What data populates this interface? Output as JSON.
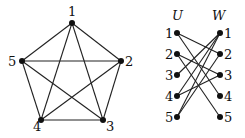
{
  "k5": {
    "vertices": [
      {
        "label": "1",
        "x": 72,
        "y": 23,
        "lx": 68,
        "ly": 16
      },
      {
        "label": "2",
        "x": 121,
        "y": 61,
        "lx": 125,
        "ly": 66
      },
      {
        "label": "3",
        "x": 103,
        "y": 120,
        "lx": 106,
        "ly": 131
      },
      {
        "label": "4",
        "x": 41,
        "y": 120,
        "lx": 33,
        "ly": 131
      },
      {
        "label": "5",
        "x": 22,
        "y": 61,
        "lx": 8,
        "ly": 66
      }
    ],
    "edges": [
      [
        0,
        1
      ],
      [
        0,
        2
      ],
      [
        0,
        3
      ],
      [
        0,
        4
      ],
      [
        1,
        2
      ],
      [
        1,
        3
      ],
      [
        1,
        4
      ],
      [
        2,
        3
      ],
      [
        2,
        4
      ],
      [
        3,
        4
      ]
    ]
  },
  "bipartite": {
    "left_title": "U",
    "right_title": "W",
    "left": [
      "1",
      "2",
      "3",
      "4",
      "5"
    ],
    "right": [
      "1",
      "2",
      "3",
      "4",
      "5"
    ],
    "edges": [
      [
        0,
        1
      ],
      [
        0,
        3
      ],
      [
        1,
        2
      ],
      [
        1,
        4
      ],
      [
        2,
        0
      ],
      [
        3,
        0
      ],
      [
        3,
        2
      ],
      [
        4,
        0
      ],
      [
        4,
        1
      ]
    ]
  }
}
